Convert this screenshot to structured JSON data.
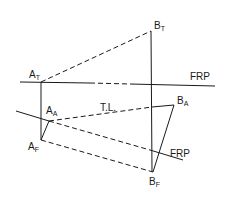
{
  "diagram": {
    "type": "descriptive-geometry-true-length",
    "points": {
      "A_T": {
        "label": "A",
        "subscript": "T",
        "x": 41,
        "y": 82
      },
      "B_T": {
        "label": "B",
        "subscript": "T",
        "x": 151,
        "y": 31
      },
      "A_F": {
        "label": "A",
        "subscript": "F",
        "x": 41,
        "y": 140
      },
      "B_F": {
        "label": "B",
        "subscript": "F",
        "x": 153,
        "y": 172
      },
      "A_A": {
        "label": "A",
        "subscript": "A",
        "x": 49,
        "y": 121
      },
      "B_A": {
        "label": "B",
        "subscript": "A",
        "x": 174,
        "y": 105
      }
    },
    "labels": {
      "frp_top": "FRP",
      "frp_aux": "FRP",
      "true_length": "T.L."
    },
    "colors": {
      "line": "#1a1a1a",
      "background": "#ffffff"
    }
  }
}
